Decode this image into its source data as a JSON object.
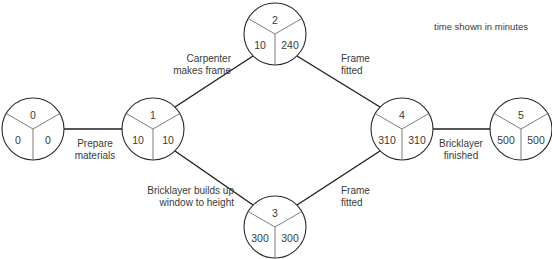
{
  "diagram": {
    "note": "time shown in minutes",
    "colors": {
      "line": "#1e1e1e",
      "text": "#3a3a3a",
      "divider": "#6e6e6e"
    },
    "nodes": [
      {
        "id": "0",
        "earliest": "0",
        "latest": "0"
      },
      {
        "id": "1",
        "earliest": "10",
        "latest": "10"
      },
      {
        "id": "2",
        "earliest": "10",
        "latest": "240"
      },
      {
        "id": "3",
        "earliest": "300",
        "latest": "300"
      },
      {
        "id": "4",
        "earliest": "310",
        "latest": "310"
      },
      {
        "id": "5",
        "earliest": "500",
        "latest": "500"
      }
    ],
    "activities": [
      {
        "from": "0",
        "to": "1",
        "lines": [
          "Prepare",
          "materials"
        ]
      },
      {
        "from": "1",
        "to": "2",
        "lines": [
          "Carpenter",
          "makes frame"
        ]
      },
      {
        "from": "1",
        "to": "3",
        "lines": [
          "Bricklayer builds up",
          "window to height"
        ]
      },
      {
        "from": "2",
        "to": "4",
        "lines": [
          "Frame",
          "fitted"
        ]
      },
      {
        "from": "3",
        "to": "4",
        "lines": [
          "Frame",
          "fitted"
        ]
      },
      {
        "from": "4",
        "to": "5",
        "lines": [
          "Bricklayer",
          "finished"
        ]
      }
    ]
  }
}
